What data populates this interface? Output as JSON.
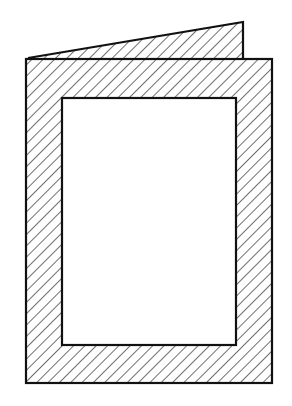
{
  "diagram": {
    "colors": {
      "stroke": "#111111",
      "background": "#ffffff",
      "hatch": "#222222"
    },
    "back_flap": {
      "points": [
        [
          28,
          57
        ],
        [
          243,
          22
        ],
        [
          243,
          58
        ]
      ]
    },
    "front_panel": {
      "x": 26,
      "y": 59,
      "width": 246,
      "height": 324
    },
    "window": {
      "x": 62,
      "y": 98,
      "width": 174,
      "height": 247
    },
    "hatch_spacing": 8
  }
}
